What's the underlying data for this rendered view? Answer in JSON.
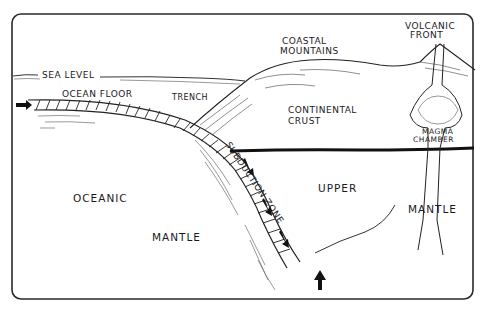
{
  "diagram": {
    "labels": {
      "sea_level": "Sea Level",
      "ocean_floor": "Ocean Floor",
      "trench": "Trench",
      "coastal_mountains_1": "Coastal",
      "coastal_mountains_2": "Mountains",
      "volcanic_front_1": "Volcanic",
      "volcanic_front_2": "Front",
      "continental_crust_1": "Continental",
      "continental_crust_2": "Crust",
      "magma_chamber_1": "Magma",
      "magma_chamber_2": "Chamber",
      "subduction_zone": "Subduction Zone",
      "oceanic": "Oceanic",
      "mantle_left": "Mantle",
      "upper": "Upper",
      "mantle_right": "Mantle"
    },
    "colors": {
      "ink": "#1a1a1a",
      "background": "#ffffff"
    }
  }
}
